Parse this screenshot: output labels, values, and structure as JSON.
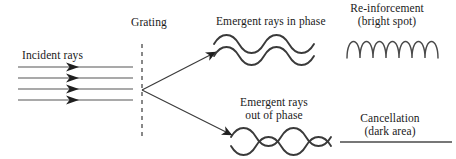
{
  "diagram": {
    "title_visible": false,
    "labels": {
      "incident_rays": "Incident rays",
      "grating": "Grating",
      "emergent_in_phase": "Emergent rays in phase",
      "emergent_out_of_phase_line1": "Emergent rays",
      "emergent_out_of_phase_line2": "out of phase",
      "reinforcement_line1": "Re-inforcement",
      "reinforcement_line2": "(bright spot)",
      "cancellation_line1": "Cancellation",
      "cancellation_line2": "(dark area)"
    },
    "colors": {
      "ink": "#333333",
      "text": "#1a1a1a",
      "background": "#ffffff"
    },
    "elements": {
      "incident_ray_count": 4,
      "incident_ray_y": [
        67,
        78,
        89,
        100
      ],
      "incident_ray_x_start": 18,
      "incident_ray_x_end": 133,
      "incident_arrowhead_x": 78,
      "grating_line_x": 142,
      "grating_line_y_top": 44,
      "grating_line_y_bottom": 140,
      "grating_dash_pattern": "4 4",
      "vertex_x": 142,
      "vertex_y": 90,
      "upper_ray_end_x": 216,
      "upper_ray_end_y": 52,
      "lower_ray_end_x": 232,
      "lower_ray_end_y": 135,
      "in_phase_wave_cycles": 3,
      "out_of_phase_wave_cycles": 3,
      "square_wave_cycles": 3,
      "cancellation_line_x_start": 340,
      "cancellation_line_x_end": 452,
      "cancellation_line_y": 142
    }
  }
}
